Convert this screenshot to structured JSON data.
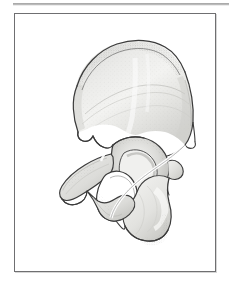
{
  "document": {
    "kind": "anatomical-illustration",
    "subject": "Hip bone (os coxae) — lateral view",
    "caption": ""
  },
  "frame": {
    "border_color": "#6f6f71",
    "background_color": "#ffffff",
    "rule_color": "#9c9c9c"
  },
  "illustration": {
    "name": "hip-bone-lateral-view",
    "outline_color": "#3b3b3b",
    "fill_color": "#e8e8e6",
    "shade_light": "#f4f4f2",
    "shade_mid": "#dcdcd9",
    "shade_dark": "#b9b9b5",
    "stipple_color": "#8d8d8a",
    "background_color": "#ffffff",
    "regions": [
      {
        "name": "ilium",
        "label": "Ilium"
      },
      {
        "name": "iliac-crest",
        "label": "Iliac crest"
      },
      {
        "name": "anterior-superior-iliac-spine",
        "label": "Anterior superior iliac spine"
      },
      {
        "name": "anterior-inferior-iliac-spine",
        "label": "Anterior inferior iliac spine"
      },
      {
        "name": "posterior-superior-iliac-spine",
        "label": "Posterior superior iliac spine"
      },
      {
        "name": "greater-sciatic-notch",
        "label": "Greater sciatic notch"
      },
      {
        "name": "ischial-spine",
        "label": "Ischial spine"
      },
      {
        "name": "lesser-sciatic-notch",
        "label": "Lesser sciatic notch"
      },
      {
        "name": "acetabulum",
        "label": "Acetabulum"
      },
      {
        "name": "obturator-foramen",
        "label": "Obturator foramen"
      },
      {
        "name": "superior-pubic-ramus",
        "label": "Superior pubic ramus"
      },
      {
        "name": "inferior-pubic-ramus",
        "label": "Inferior pubic ramus"
      },
      {
        "name": "ischial-tuberosity",
        "label": "Ischial tuberosity"
      },
      {
        "name": "ischial-ramus",
        "label": "Ischial ramus"
      },
      {
        "name": "pubic-body",
        "label": "Body of pubis"
      }
    ]
  }
}
